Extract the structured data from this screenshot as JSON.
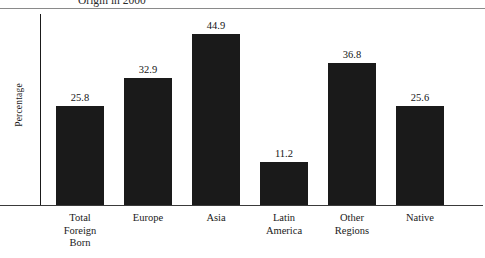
{
  "figure": {
    "title_partial": "Origin in 2000",
    "ylabel": "Percentage"
  },
  "chart_data": {
    "type": "bar",
    "title": "Origin in 2000",
    "xlabel": "",
    "ylabel": "Percentage",
    "ylim": [
      0,
      50
    ],
    "grid": false,
    "legend": null,
    "categories": [
      "Total Foreign Born",
      "Europe",
      "Asia",
      "Latin America",
      "Other Regions",
      "Native"
    ],
    "category_lines": [
      [
        "Total",
        "Foreign",
        "Born"
      ],
      [
        "Europe"
      ],
      [
        "Asia"
      ],
      [
        "Latin",
        "America"
      ],
      [
        "Other",
        "Regions"
      ],
      [
        "Native"
      ]
    ],
    "values": [
      25.8,
      32.9,
      44.9,
      11.2,
      36.8,
      25.6
    ],
    "value_labels": [
      "25.8",
      "32.9",
      "44.9",
      "11.2",
      "36.8",
      "25.6"
    ],
    "bar_color": "#1a1a1a"
  }
}
